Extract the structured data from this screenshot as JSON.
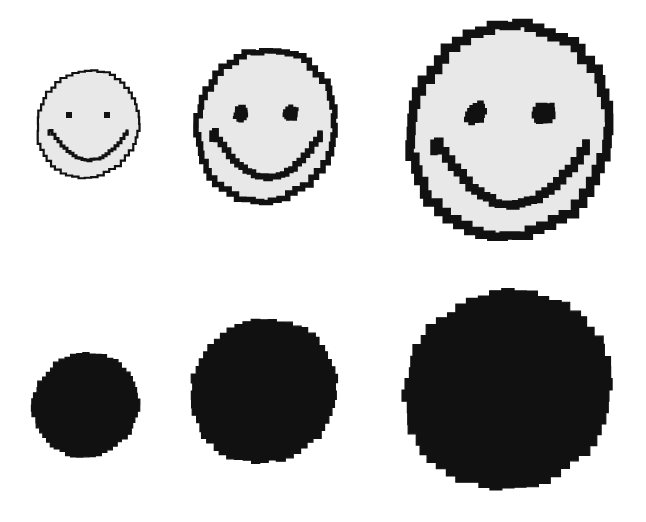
{
  "figure": {
    "width": 646,
    "height": 522,
    "background_color": "#ffffff",
    "ink_color": "#111111",
    "face_fill_color": "#e8e8e8",
    "rows": [
      {
        "name": "smiley-row",
        "label": "Smiley faces",
        "shape_kind": "smiley-face"
      },
      {
        "name": "circle-row",
        "label": "Solid circles",
        "shape_kind": "solid-circle"
      }
    ],
    "shapes": [
      {
        "id": "smiley-small",
        "kind": "smiley-face",
        "size_label": "small",
        "x": 33,
        "y": 66,
        "width": 110,
        "height": 116,
        "radius": 55,
        "outline_width": 2.2,
        "eye_shape": "square",
        "eye_size": 6,
        "eye_offset_x": 19,
        "eye_offset_y": -9,
        "mouth_width": 3.0,
        "mouth_span": 78,
        "mouth_depth": 30,
        "mouth_offset_y": 6,
        "fill": "#e8e8e8",
        "stroke": "#111111",
        "jitter": 1.1
      },
      {
        "id": "smiley-medium",
        "kind": "smiley-face",
        "size_label": "medium",
        "x": 191,
        "y": 44,
        "width": 150,
        "height": 163,
        "radius": 75,
        "outline_width": 5.5,
        "eye_shape": "round",
        "eye_size": 14,
        "eye_offset_x": 25,
        "eye_offset_y": -12,
        "mouth_width": 5.5,
        "mouth_span": 108,
        "mouth_depth": 46,
        "mouth_offset_y": 6,
        "fill": "#e8e8e8",
        "stroke": "#111111",
        "jitter": 1.8
      },
      {
        "id": "smiley-large",
        "kind": "smiley-face",
        "size_label": "large",
        "x": 403,
        "y": 18,
        "width": 214,
        "height": 226,
        "radius": 107,
        "outline_width": 8.5,
        "eye_shape": "round",
        "eye_size": 20,
        "eye_offset_x": 34,
        "eye_offset_y": -18,
        "mouth_width": 7.5,
        "mouth_span": 152,
        "mouth_depth": 64,
        "mouth_offset_y": 10,
        "fill": "#e8e8e8",
        "stroke": "#111111",
        "jitter": 2.4
      },
      {
        "id": "circle-small",
        "kind": "solid-circle",
        "size_label": "small",
        "x": 30,
        "y": 350,
        "width": 112,
        "height": 110,
        "radius": 55,
        "fill": "#111111",
        "jitter": 1.6
      },
      {
        "id": "circle-medium",
        "kind": "solid-circle",
        "size_label": "medium",
        "x": 188,
        "y": 316,
        "width": 152,
        "height": 150,
        "radius": 75,
        "fill": "#111111",
        "jitter": 2.2
      },
      {
        "id": "circle-large",
        "kind": "solid-circle",
        "size_label": "large",
        "x": 401,
        "y": 288,
        "width": 214,
        "height": 204,
        "radius": 102,
        "fill": "#111111",
        "jitter": 2.8
      }
    ]
  }
}
